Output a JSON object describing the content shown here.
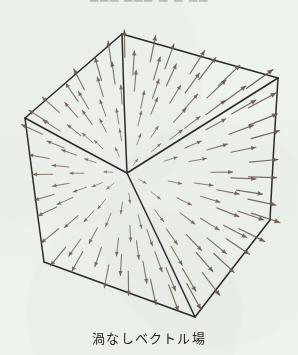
{
  "page": {
    "background_color": "#eef2ec",
    "ink_color": "#2a2a2a",
    "arrow_color": "#6b5a50",
    "top_fragment_text": "▁▁▁ ▁▁▁  ▁  ▁  ▁▁"
  },
  "caption": {
    "text": "渦なしベクトル場"
  },
  "chart_data": {
    "type": "scatter",
    "title": "渦なしベクトル場",
    "subtitle": "",
    "xlabel": "",
    "ylabel": "",
    "grid": false,
    "legend": null,
    "field": {
      "kind": "radial-source",
      "center": {
        "x": 127,
        "y": 173
      },
      "curl": 0,
      "divergence": "positive",
      "arrow_count": 152,
      "min_length": 6,
      "max_length": 34,
      "color": "#6b5a50"
    },
    "cube": {
      "stroke": "#2a2a2a",
      "stroke_width": 1.5,
      "vertices": {
        "top_back": {
          "x": 122,
          "y": 34
        },
        "left_back": {
          "x": 25,
          "y": 118
        },
        "right_back": {
          "x": 278,
          "y": 78
        },
        "center_front": {
          "x": 127,
          "y": 173
        },
        "bottom_left": {
          "x": 44,
          "y": 262
        },
        "bottom_front": {
          "x": 195,
          "y": 317
        },
        "bottom_right": {
          "x": 270,
          "y": 220
        },
        "top_right_hidden": {
          "x": 246,
          "y": 126
        }
      },
      "edges": [
        [
          "top_back",
          "left_back"
        ],
        [
          "top_back",
          "right_back"
        ],
        [
          "top_back",
          "center_front"
        ],
        [
          "left_back",
          "center_front"
        ],
        [
          "right_back",
          "center_front"
        ],
        [
          "left_back",
          "bottom_left"
        ],
        [
          "center_front",
          "bottom_front"
        ],
        [
          "right_back",
          "bottom_right"
        ],
        [
          "bottom_left",
          "bottom_front"
        ],
        [
          "bottom_front",
          "bottom_right"
        ]
      ]
    }
  }
}
